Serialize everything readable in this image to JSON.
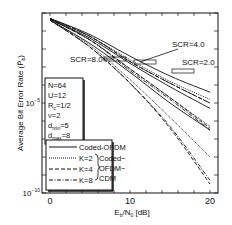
{
  "chart_data": {
    "type": "line",
    "title": "",
    "xlabel": "Eb/N0 [dB]",
    "ylabel": "Average Bit Error Rate (Pb~)",
    "xlim": [
      -1,
      21
    ],
    "ylim_log10": [
      -10,
      0
    ],
    "x_ticks": [
      "0",
      "10",
      "20"
    ],
    "y_ticks": [
      "10^-5",
      "10^-10"
    ],
    "params_box": [
      "N=64",
      "U=12",
      "Rc=1/2",
      "ν=2",
      "dmin=5",
      "dmax=8"
    ],
    "legend": {
      "entries": [
        {
          "label": "Coded-OFDM",
          "style": "solid"
        },
        {
          "label": "K=2",
          "style": "dotted"
        },
        {
          "label": "K=4",
          "style": "dashed"
        },
        {
          "label": "K=8",
          "style": "dashdot"
        }
      ],
      "group_label": "Coded-OFDM-CDM"
    },
    "annotations": [
      "SCR=8.0",
      "SCR=4.0",
      "SCR=2.0"
    ],
    "x": [
      0,
      5,
      10,
      15,
      20
    ],
    "series": [
      {
        "name": "Coded-OFDM SCR=2.0",
        "style": "solid",
        "log10_values": [
          -0.3,
          -1.2,
          -2.4,
          -3.5,
          -4.4
        ]
      },
      {
        "name": "K=2 SCR=2.0",
        "style": "dotted",
        "log10_values": [
          -0.3,
          -1.3,
          -2.6,
          -3.8,
          -4.8
        ]
      },
      {
        "name": "K=4 SCR=2.0",
        "style": "dashed",
        "log10_values": [
          -0.3,
          -1.3,
          -2.7,
          -3.9,
          -5.0
        ]
      },
      {
        "name": "K=8 SCR=2.0",
        "style": "dashdot",
        "log10_values": [
          -0.3,
          -1.3,
          -2.7,
          -3.9,
          -5.0
        ]
      },
      {
        "name": "Coded-OFDM SCR=4.0",
        "style": "solid",
        "log10_values": [
          -0.35,
          -1.4,
          -2.8,
          -4.1,
          -5.3
        ]
      },
      {
        "name": "K=2 SCR=4.0",
        "style": "dotted",
        "log10_values": [
          -0.35,
          -1.5,
          -3.1,
          -4.7,
          -6.3
        ]
      },
      {
        "name": "K=4 SCR=4.0",
        "style": "dashed",
        "log10_values": [
          -0.35,
          -1.5,
          -3.1,
          -4.7,
          -6.4
        ]
      },
      {
        "name": "K=8 SCR=4.0",
        "style": "dashdot",
        "log10_values": [
          -0.35,
          -1.5,
          -3.2,
          -4.8,
          -6.5
        ]
      },
      {
        "name": "Coded-OFDM SCR=8.0",
        "style": "solid",
        "log10_values": [
          -0.4,
          -1.7,
          -3.3,
          -5.0,
          -6.5
        ]
      },
      {
        "name": "K=2 SCR=8.0",
        "style": "dotted",
        "log10_values": [
          -0.4,
          -1.8,
          -3.7,
          -5.8,
          -8.0
        ]
      },
      {
        "name": "K=4 SCR=8.0",
        "style": "dashed",
        "log10_values": [
          -0.4,
          -1.9,
          -3.9,
          -6.4,
          -9.5
        ]
      },
      {
        "name": "K=8 SCR=8.0",
        "style": "dashdot",
        "log10_values": [
          -0.4,
          -1.9,
          -3.9,
          -6.3,
          -9.3
        ]
      }
    ]
  }
}
